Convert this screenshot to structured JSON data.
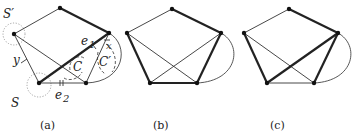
{
  "figure": {
    "panels": [
      {
        "caption": "(a)",
        "labels": {
          "s_prime": "S′",
          "s": "S",
          "y": "y",
          "x": "x",
          "e1": "e",
          "e1_sub": "1",
          "e2": "e",
          "e2_sub": "2",
          "c": "C",
          "c_prime": "C′"
        }
      },
      {
        "caption": "(b)"
      },
      {
        "caption": "(c)"
      }
    ],
    "vertices": [
      "top",
      "left",
      "right",
      "bottom-left",
      "bottom-right"
    ],
    "colors": {
      "edge": "#222222",
      "region": "#999999",
      "background": "#ffffff"
    }
  }
}
